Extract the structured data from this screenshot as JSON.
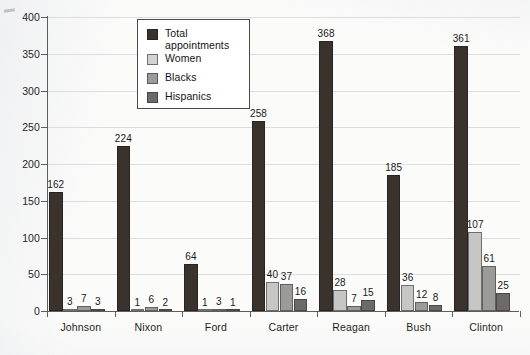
{
  "chart_data": {
    "type": "bar",
    "title": "",
    "xlabel": "",
    "ylabel": "",
    "ylim": [
      0,
      400
    ],
    "ytick_step": 50,
    "yticks": [
      0,
      50,
      100,
      150,
      200,
      250,
      300,
      350,
      400
    ],
    "grid": true,
    "legend_position": "top-center",
    "categories": [
      "Johnson",
      "Nixon",
      "Ford",
      "Carter",
      "Reagan",
      "Bush",
      "Clinton"
    ],
    "series": [
      {
        "name": "Total appointments",
        "color": "#3a322d",
        "values": [
          162,
          224,
          64,
          258,
          368,
          185,
          361
        ]
      },
      {
        "name": "Women",
        "color": "#c6c6c4",
        "values": [
          3,
          1,
          1,
          40,
          28,
          36,
          107
        ]
      },
      {
        "name": "Blacks",
        "color": "#9b9b9a",
        "values": [
          7,
          6,
          3,
          37,
          7,
          12,
          61
        ]
      },
      {
        "name": "Hispanics",
        "color": "#6d6a68",
        "values": [
          3,
          2,
          1,
          16,
          15,
          8,
          25
        ]
      }
    ]
  },
  "legend": {
    "entries": [
      {
        "label": "Total appointments",
        "swatch": "s0"
      },
      {
        "label": "Women",
        "swatch": "s1"
      },
      {
        "label": "Blacks",
        "swatch": "s2"
      },
      {
        "label": "Hispanics",
        "swatch": "s3"
      }
    ]
  },
  "axes": {
    "y_tick_labels": [
      "400",
      "350",
      "300",
      "250",
      "200",
      "150",
      "100",
      "50",
      "0"
    ],
    "x_tick_labels": [
      "Johnson",
      "Nixon",
      "Ford",
      "Carter",
      "Reagan",
      "Bush",
      "Clinton"
    ]
  }
}
